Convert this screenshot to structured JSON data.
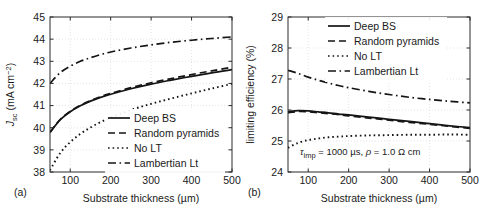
{
  "figure": {
    "panel_a_tag": "(a)",
    "panel_b_tag": "(b)",
    "line_color": "#141414",
    "grid_color": "#d8d8d8",
    "frame_color": "#2b2b2b"
  },
  "chart_data": [
    {
      "type": "line",
      "panel": "(a)",
      "title": "",
      "xlabel": "Substrate thickness (µm)",
      "ylabel": "J_sc (mA cm^-2)",
      "ylabel_parts": {
        "symbol": "J",
        "symbol_sub": "sc",
        "unit": "(mA cm",
        "unit_sup": "−2",
        "unit_close": ")"
      },
      "xlim": [
        50,
        500
      ],
      "ylim": [
        38,
        45
      ],
      "xticks": [
        100,
        200,
        300,
        400,
        500
      ],
      "yticks": [
        38,
        39,
        40,
        41,
        42,
        43,
        44,
        45
      ],
      "xtick_labels": [
        "100",
        "200",
        "300",
        "400",
        "500"
      ],
      "ytick_labels": [
        "38",
        "39",
        "40",
        "41",
        "42",
        "43",
        "44",
        "45"
      ],
      "grid": true,
      "legend_position": "lower-right-inside",
      "x": [
        50,
        75,
        100,
        125,
        150,
        175,
        200,
        250,
        300,
        350,
        400,
        450,
        500
      ],
      "series": [
        {
          "name": "Deep BS",
          "style": "solid",
          "values": [
            39.78,
            40.35,
            40.72,
            40.99,
            41.2,
            41.37,
            41.51,
            41.76,
            41.97,
            42.15,
            42.32,
            42.48,
            42.62
          ]
        },
        {
          "name": "Random pyramids",
          "style": "dashed",
          "values": [
            39.8,
            40.37,
            40.74,
            41.01,
            41.22,
            41.4,
            41.55,
            41.81,
            42.03,
            42.22,
            42.4,
            42.57,
            42.73
          ]
        },
        {
          "name": "No LT",
          "style": "dotted",
          "values": [
            38.08,
            38.85,
            39.35,
            39.72,
            40.01,
            40.25,
            40.46,
            40.8,
            41.08,
            41.32,
            41.55,
            41.77,
            41.98
          ]
        },
        {
          "name": "Lambertian Lt",
          "style": "dashdot",
          "values": [
            42.0,
            42.48,
            42.78,
            43.0,
            43.16,
            43.3,
            43.42,
            43.6,
            43.74,
            43.86,
            43.95,
            44.03,
            44.1
          ]
        }
      ]
    },
    {
      "type": "line",
      "panel": "(b)",
      "title": "",
      "xlabel": "Substrate thickness (µm)",
      "ylabel": "limiting efficiency (%)",
      "xlim": [
        50,
        500
      ],
      "ylim": [
        24,
        29
      ],
      "xticks": [
        100,
        200,
        300,
        400,
        500
      ],
      "yticks": [
        24,
        25,
        26,
        27,
        28,
        29
      ],
      "xtick_labels": [
        "100",
        "200",
        "300",
        "400",
        "500"
      ],
      "ytick_labels": [
        "24",
        "25",
        "26",
        "27",
        "28",
        "29"
      ],
      "grid": true,
      "legend_position": "upper-right-inside",
      "annotation": "τ_imp = 1000 µs, ρ = 1.0 Ω cm",
      "annotation_parts": {
        "tau": "τ",
        "tau_sub": "imp",
        "mid": " = 1000 µs, ",
        "rho": "ρ",
        "tail": " = 1.0 Ω cm"
      },
      "x": [
        50,
        75,
        100,
        125,
        150,
        175,
        200,
        250,
        300,
        350,
        400,
        450,
        500
      ],
      "series": [
        {
          "name": "Deep BS",
          "style": "solid",
          "values": [
            25.95,
            25.98,
            25.97,
            25.94,
            25.91,
            25.87,
            25.84,
            25.77,
            25.7,
            25.63,
            25.56,
            25.49,
            25.43
          ]
        },
        {
          "name": "Random pyramids",
          "style": "dashed",
          "values": [
            25.91,
            25.95,
            25.94,
            25.91,
            25.88,
            25.85,
            25.81,
            25.74,
            25.67,
            25.6,
            25.54,
            25.47,
            25.41
          ]
        },
        {
          "name": "No LT",
          "style": "dotted",
          "values": [
            24.78,
            24.94,
            25.03,
            25.08,
            25.12,
            25.14,
            25.16,
            25.18,
            25.19,
            25.2,
            25.2,
            25.21,
            25.2
          ]
        },
        {
          "name": "Lambertian Lt",
          "style": "dashdot",
          "values": [
            27.28,
            27.18,
            27.06,
            26.96,
            26.87,
            26.79,
            26.72,
            26.6,
            26.5,
            26.41,
            26.34,
            26.28,
            26.23
          ]
        }
      ]
    }
  ]
}
